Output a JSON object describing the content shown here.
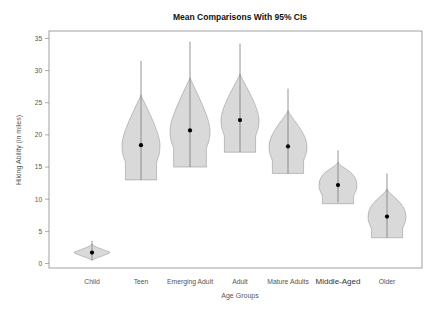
{
  "chart_data": {
    "type": "violin",
    "title": "Mean Comparisons With 95% CIs",
    "xlabel": "Age Groups",
    "ylabel": "Hiking Ability (in miles)",
    "ylim": [
      0,
      35
    ],
    "yticks": [
      0,
      5,
      10,
      15,
      20,
      25,
      30,
      35
    ],
    "grid": false,
    "legend": null,
    "categories": [
      "Child",
      "Teen",
      "Emerging Adult",
      "Adult",
      "Mature Adults",
      "Middle-Aged",
      "Older"
    ],
    "means": [
      1.7,
      18.4,
      20.7,
      22.3,
      18.2,
      12.2,
      7.3
    ],
    "whisker_top": [
      3.5,
      31.5,
      34.5,
      34.2,
      27.2,
      17.6,
      14.0
    ],
    "whisker_bottom": [
      0.5,
      13.0,
      15.0,
      17.3,
      14.0,
      9.5,
      4.0
    ],
    "violin_bottom": [
      0.5,
      13.0,
      15.0,
      17.3,
      14.0,
      9.3,
      4.0
    ],
    "violin_halfwidth_px": [
      18,
      19,
      20,
      19,
      19,
      19,
      19
    ]
  },
  "colors": {
    "violin_fill": "#d9d9d9",
    "violin_stroke": "#7a7a7a",
    "mean_dot": "#000000",
    "axis": "#8a8a8a"
  }
}
